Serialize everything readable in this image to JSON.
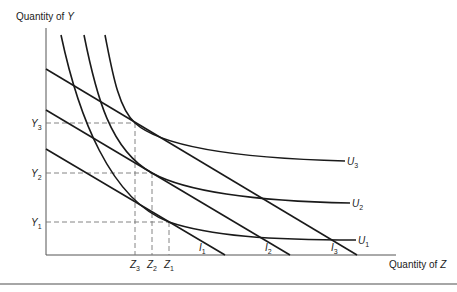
{
  "figure": {
    "y_axis_label_main": "Quantity of ",
    "y_axis_label_var": "Y",
    "x_axis_label_main": "Quantity of ",
    "x_axis_label_var": "Z",
    "y_ticks": [
      {
        "letter": "Y",
        "sub": "3"
      },
      {
        "letter": "Y",
        "sub": "2"
      },
      {
        "letter": "Y",
        "sub": "1"
      }
    ],
    "x_ticks": [
      {
        "letter": "Z",
        "sub": "3"
      },
      {
        "letter": "Z",
        "sub": "2"
      },
      {
        "letter": "Z",
        "sub": "1"
      }
    ],
    "indifference_curves": [
      {
        "letter": "U",
        "sub": "3"
      },
      {
        "letter": "U",
        "sub": "2"
      },
      {
        "letter": "U",
        "sub": "1"
      }
    ],
    "budget_lines": [
      {
        "letter": "I",
        "sub": "1"
      },
      {
        "letter": "I",
        "sub": "2"
      },
      {
        "letter": "I",
        "sub": "3"
      }
    ],
    "colors": {
      "line": "#1a1a1a",
      "axis": "#555555",
      "dash": "#777777",
      "rule": "#888888"
    }
  }
}
